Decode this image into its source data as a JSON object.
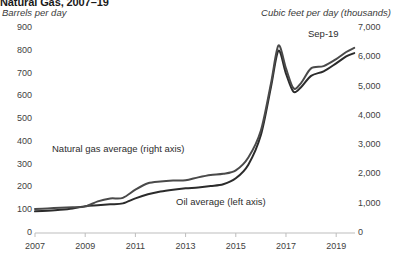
{
  "chart_data": {
    "type": "line",
    "title": "Natural Gas, 2007–19",
    "ylabel_left": "Barrels per day",
    "ylabel_right": "Cubic feet per day (thousands)",
    "xlabel": "",
    "grid": false,
    "legend_position": "inline-annotation",
    "x_ticks": [
      "2007",
      "2009",
      "2011",
      "2013",
      "2015",
      "2017",
      "2019"
    ],
    "x_tick_values": [
      2007,
      2009,
      2011,
      2013,
      2015,
      2017,
      2019
    ],
    "xlim": [
      2007,
      2019.75
    ],
    "y_left_ticks": [
      "0",
      "100",
      "200",
      "300",
      "400",
      "500",
      "600",
      "700",
      "800",
      "900"
    ],
    "y_left_values": [
      0,
      100,
      200,
      300,
      400,
      500,
      600,
      700,
      800,
      900
    ],
    "ylim_left": [
      0,
      900
    ],
    "y_right_ticks": [
      "0",
      "1,000",
      "2,000",
      "3,000",
      "4,000",
      "5,000",
      "6,000",
      "7,000"
    ],
    "y_right_values": [
      0,
      1000,
      2000,
      3000,
      4000,
      5000,
      6000,
      7000
    ],
    "ylim_right": [
      0,
      7000
    ],
    "annotations": [
      {
        "text": "Sep-19",
        "x": 2019.2,
        "y": 6500,
        "axis": "right"
      }
    ],
    "series": [
      {
        "name": "Oil average (left axis)",
        "label": "Oil average (left axis)",
        "axis": "left",
        "color": "#2b2b2b",
        "x": [
          2007.0,
          2007.5,
          2008.0,
          2008.5,
          2009.0,
          2009.5,
          2010.0,
          2010.5,
          2011.0,
          2011.5,
          2012.0,
          2012.5,
          2013.0,
          2013.5,
          2014.0,
          2014.5,
          2015.0,
          2015.5,
          2016.0,
          2016.4,
          2016.7,
          2017.0,
          2017.3,
          2017.6,
          2018.0,
          2018.5,
          2019.0,
          2019.4,
          2019.72
        ],
        "values": [
          95,
          98,
          102,
          108,
          118,
          122,
          126,
          130,
          152,
          170,
          182,
          190,
          196,
          200,
          206,
          214,
          240,
          300,
          430,
          640,
          800,
          700,
          620,
          640,
          690,
          710,
          745,
          775,
          790
        ]
      },
      {
        "name": "Natural gas average (right axis)",
        "label": "Natural gas average (right axis)",
        "axis": "right",
        "color": "#4a4a4a",
        "x": [
          2007.0,
          2007.5,
          2008.0,
          2008.5,
          2009.0,
          2009.5,
          2010.0,
          2010.5,
          2011.0,
          2011.5,
          2012.0,
          2012.5,
          2013.0,
          2013.5,
          2014.0,
          2014.5,
          2015.0,
          2015.5,
          2016.0,
          2016.4,
          2016.7,
          2017.0,
          2017.3,
          2017.6,
          2018.0,
          2018.5,
          2019.0,
          2019.4,
          2019.72
        ],
        "values": [
          820,
          840,
          860,
          880,
          900,
          1080,
          1180,
          1200,
          1480,
          1700,
          1760,
          1790,
          1800,
          1900,
          1980,
          2020,
          2140,
          2580,
          3500,
          5100,
          6400,
          5620,
          4940,
          5120,
          5620,
          5700,
          5940,
          6180,
          6320
        ]
      }
    ]
  },
  "axis_style": {
    "axis_line_color": "#bdbdbd",
    "tick_color": "#bdbdbd",
    "text_color": "#3f3f3f"
  }
}
